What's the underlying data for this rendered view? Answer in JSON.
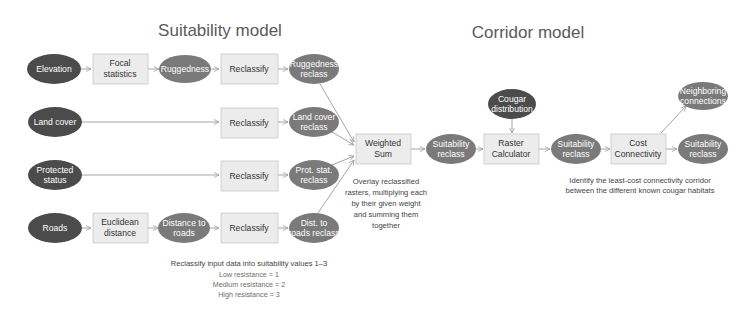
{
  "titles": {
    "suitability": "Suitability model",
    "corridor": "Corridor model"
  },
  "colors": {
    "input_ellipse": "#4b4b4b",
    "derived_ellipse": "#7a7a7a",
    "process_box_fill": "#ececec",
    "process_box_stroke": "#c9c9c9",
    "arrow": "#9a9a9a",
    "title_text": "#5a5a5a"
  },
  "nodes": {
    "elevation": {
      "lines": [
        "Elevation"
      ],
      "type": "input"
    },
    "focal_statistics": {
      "lines": [
        "Focal",
        "statistics"
      ],
      "type": "process"
    },
    "ruggedness": {
      "lines": [
        "Ruggedness"
      ],
      "type": "derived"
    },
    "reclassify_1": {
      "lines": [
        "Reclassify"
      ],
      "type": "process"
    },
    "ruggedness_reclass": {
      "lines": [
        "Ruggedness",
        "reclass"
      ],
      "type": "derived"
    },
    "land_cover": {
      "lines": [
        "Land cover"
      ],
      "type": "input"
    },
    "reclassify_2": {
      "lines": [
        "Reclassify"
      ],
      "type": "process"
    },
    "land_cover_reclass": {
      "lines": [
        "Land cover",
        "reclass"
      ],
      "type": "derived"
    },
    "protected_status": {
      "lines": [
        "Protected",
        "status"
      ],
      "type": "input"
    },
    "reclassify_3": {
      "lines": [
        "Reclassify"
      ],
      "type": "process"
    },
    "prot_stat_reclass": {
      "lines": [
        "Prot. stat.",
        "reclass"
      ],
      "type": "derived"
    },
    "roads": {
      "lines": [
        "Roads"
      ],
      "type": "input"
    },
    "euclidean_distance": {
      "lines": [
        "Euclidean",
        "distance"
      ],
      "type": "process"
    },
    "distance_to_roads": {
      "lines": [
        "Distance to",
        "roads"
      ],
      "type": "derived"
    },
    "reclassify_4": {
      "lines": [
        "Reclassify"
      ],
      "type": "process"
    },
    "dist_roads_reclass": {
      "lines": [
        "Dist. to",
        "roads reclass"
      ],
      "type": "derived"
    },
    "weighted_sum": {
      "lines": [
        "Weighted",
        "Sum"
      ],
      "type": "process"
    },
    "suitability_reclass_1": {
      "lines": [
        "Suitability",
        "reclass"
      ],
      "type": "derived"
    },
    "cougar_distribution": {
      "lines": [
        "Cougar",
        "distribution"
      ],
      "type": "input"
    },
    "raster_calculator": {
      "lines": [
        "Raster",
        "Calculator"
      ],
      "type": "process"
    },
    "suitability_reclass_2": {
      "lines": [
        "Suitability",
        "reclass"
      ],
      "type": "derived"
    },
    "cost_connectivity": {
      "lines": [
        "Cost",
        "Connectivity"
      ],
      "type": "process"
    },
    "neighboring_connections": {
      "lines": [
        "Neighboring",
        "connections"
      ],
      "type": "derived"
    },
    "suitability_reclass_3": {
      "lines": [
        "Suitability",
        "reclass"
      ],
      "type": "derived"
    }
  },
  "edges": [
    [
      "elevation",
      "focal_statistics"
    ],
    [
      "focal_statistics",
      "ruggedness"
    ],
    [
      "ruggedness",
      "reclassify_1"
    ],
    [
      "reclassify_1",
      "ruggedness_reclass"
    ],
    [
      "land_cover",
      "reclassify_2"
    ],
    [
      "reclassify_2",
      "land_cover_reclass"
    ],
    [
      "protected_status",
      "reclassify_3"
    ],
    [
      "reclassify_3",
      "prot_stat_reclass"
    ],
    [
      "roads",
      "euclidean_distance"
    ],
    [
      "euclidean_distance",
      "distance_to_roads"
    ],
    [
      "distance_to_roads",
      "reclassify_4"
    ],
    [
      "reclassify_4",
      "dist_roads_reclass"
    ],
    [
      "ruggedness_reclass",
      "weighted_sum"
    ],
    [
      "land_cover_reclass",
      "weighted_sum"
    ],
    [
      "prot_stat_reclass",
      "weighted_sum"
    ],
    [
      "dist_roads_reclass",
      "weighted_sum"
    ],
    [
      "weighted_sum",
      "suitability_reclass_1"
    ],
    [
      "suitability_reclass_1",
      "raster_calculator"
    ],
    [
      "cougar_distribution",
      "raster_calculator"
    ],
    [
      "raster_calculator",
      "suitability_reclass_2"
    ],
    [
      "suitability_reclass_2",
      "cost_connectivity"
    ],
    [
      "cost_connectivity",
      "neighboring_connections"
    ],
    [
      "cost_connectivity",
      "suitability_reclass_3"
    ]
  ],
  "notes": {
    "weighted_sum": [
      "Overlay reclassified",
      "rasters, multiplying each",
      "by their given weight",
      "and summing them",
      "together"
    ],
    "reclassify": {
      "heading": "Reclassify input data into suitability values 1–3",
      "items": [
        "Low resistance = 1",
        "Medium resistance = 2",
        "High resistance = 3"
      ]
    },
    "corridor": [
      "Identify the least-cost connectivity corridor",
      "between the different known cougar habitats"
    ]
  }
}
